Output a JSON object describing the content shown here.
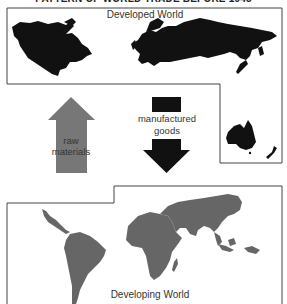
{
  "title": "PATTERN OF WORLD TRADE BEFORE 1945",
  "developed": {
    "label": "Developed World",
    "region_color": "#111111",
    "regions": [
      "North America",
      "Europe and Russia",
      "Japan",
      "Australia",
      "New Zealand"
    ]
  },
  "developing": {
    "label": "Developing World",
    "region_color": "#666666",
    "regions": [
      "Central America",
      "South America",
      "Africa",
      "Madagascar",
      "Middle East",
      "South Asia",
      "Southeast Asia"
    ]
  },
  "flows": {
    "up": {
      "label_line1": "raw",
      "label_line2": "materials",
      "color": "#777777",
      "direction": "developing-to-developed"
    },
    "down": {
      "label_line1": "manufactured",
      "label_line2": "goods",
      "color": "#111111",
      "direction": "developed-to-developing"
    }
  },
  "colors": {
    "border": "#444444",
    "background": "#ffffff"
  }
}
